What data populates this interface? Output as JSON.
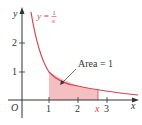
{
  "figure": {
    "curve_label_lhs": "y =",
    "curve_label_num": "1",
    "curve_label_den": "x",
    "area_label": "Area = 1",
    "axis_x_label": "x",
    "axis_y_label": "y",
    "origin_label": "O",
    "x_ticks": [
      "1",
      "2",
      "3"
    ],
    "y_ticks": [
      "1",
      "2"
    ],
    "x_marker_label": "x",
    "colors": {
      "curve": "#d9434d",
      "fill": "#f4b7b9",
      "axis": "#333333"
    }
  }
}
